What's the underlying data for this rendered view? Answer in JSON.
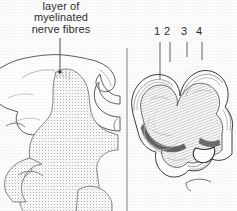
{
  "figure": {
    "type": "scientific-illustration",
    "background_color": "#fdfdfd",
    "ink_color": "#2e2e2e"
  },
  "annotations": {
    "myelin_caption": {
      "line1": "layer of",
      "line2": "myelinated",
      "line3": "nerve fibres"
    },
    "numbers": [
      {
        "label": "1",
        "x": 157,
        "y": 30,
        "leader_x": 160,
        "leader_y1": 42,
        "leader_y2": 79
      },
      {
        "label": "2",
        "x": 167,
        "y": 30,
        "leader_x": 170,
        "leader_y1": 42,
        "leader_y2": 62
      },
      {
        "label": "3",
        "x": 184,
        "y": 30,
        "leader_x": 187,
        "leader_y1": 42,
        "leader_y2": 57
      },
      {
        "label": "4",
        "x": 199,
        "y": 30,
        "leader_x": 202,
        "leader_y1": 42,
        "leader_y2": 60
      }
    ]
  },
  "panels": {
    "left": {
      "name": "left-cortex-section",
      "description": "stippled gyral section, cropped at left edge"
    },
    "right": {
      "name": "right-cortex-section",
      "description": "laminated cortical ribbon with visible striation layers"
    }
  },
  "divider": {
    "x": 127,
    "y_top": 48,
    "y_bottom": 211
  }
}
